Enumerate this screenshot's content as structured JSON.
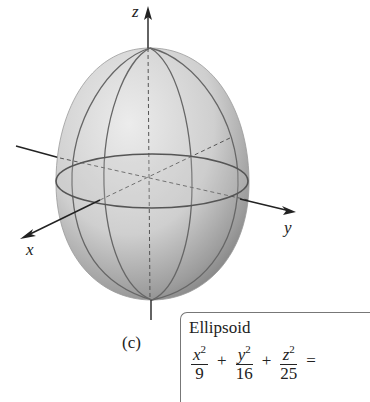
{
  "figure": {
    "caption": "(c)",
    "surface": "ellipsoid",
    "axes": {
      "z_label": "z",
      "x_label": "x",
      "y_label": "y"
    },
    "colors": {
      "surface_light": "#e6e6e6",
      "surface_dark": "#8a8a8a",
      "curve": "#555555",
      "axis": "#222222"
    }
  },
  "equation_box": {
    "title": "Ellipsoid",
    "terms": [
      {
        "var": "x",
        "exp": "2",
        "den": "9"
      },
      {
        "var": "y",
        "exp": "2",
        "den": "16"
      },
      {
        "var": "z",
        "exp": "2",
        "den": "25"
      }
    ],
    "ops": [
      "+",
      "+",
      "="
    ]
  }
}
